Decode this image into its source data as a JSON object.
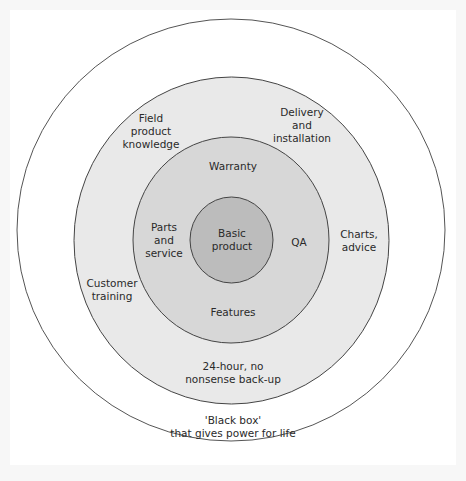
{
  "diagram": {
    "type": "concentric-circles",
    "colors": {
      "background": "#ffffff",
      "outer_ring": "#ffffff",
      "ring_2": "#e8e8e8",
      "ring_3": "#d6d6d6",
      "core": "#bdbdbd",
      "stroke": "#444444",
      "text": "#2a2a2a"
    },
    "layers": [
      {
        "name": "outer",
        "labels": [
          {
            "id": "black_box",
            "text": "'Black box'\nthat gives power for life"
          }
        ]
      },
      {
        "name": "ring-2",
        "labels": [
          {
            "id": "field_knowledge",
            "text": "Field\nproduct\nknowledge"
          },
          {
            "id": "delivery",
            "text": "Delivery\nand\ninstallation"
          },
          {
            "id": "charts",
            "text": "Charts,\nadvice"
          },
          {
            "id": "customer_training",
            "text": "Customer\ntraining"
          },
          {
            "id": "backup",
            "text": "24-hour, no\nnonsense back-up"
          }
        ]
      },
      {
        "name": "ring-3",
        "labels": [
          {
            "id": "warranty",
            "text": "Warranty"
          },
          {
            "id": "parts",
            "text": "Parts\nand\nservice"
          },
          {
            "id": "qa",
            "text": "QA"
          },
          {
            "id": "features",
            "text": "Features"
          }
        ]
      },
      {
        "name": "core",
        "labels": [
          {
            "id": "basic_product",
            "text": "Basic\nproduct"
          }
        ]
      }
    ]
  },
  "labels": {
    "black_box": "'Black box'\nthat gives power for life",
    "field_knowledge": "Field\nproduct\nknowledge",
    "delivery": "Delivery\nand\ninstallation",
    "charts": "Charts,\nadvice",
    "customer_training": "Customer\ntraining",
    "backup": "24-hour, no\nnonsense back-up",
    "warranty": "Warranty",
    "parts": "Parts\nand\nservice",
    "qa": "QA",
    "features": "Features",
    "basic_product": "Basic\nproduct"
  }
}
